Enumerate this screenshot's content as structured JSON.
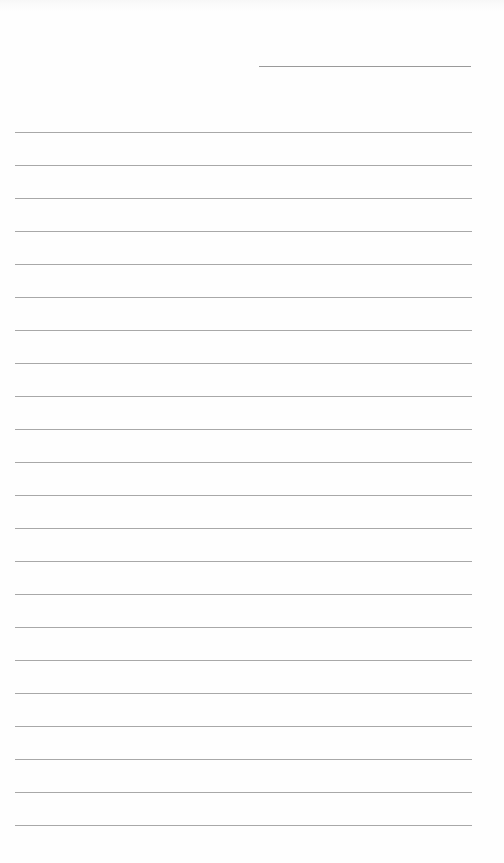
{
  "page": {
    "type": "blank lined paper",
    "background_color": "#fefefe",
    "line_color": "#a8a8a8"
  },
  "header_line": {
    "label": ""
  },
  "ruled_lines": {
    "count": 22,
    "first_y": 132,
    "spacing": 33
  }
}
